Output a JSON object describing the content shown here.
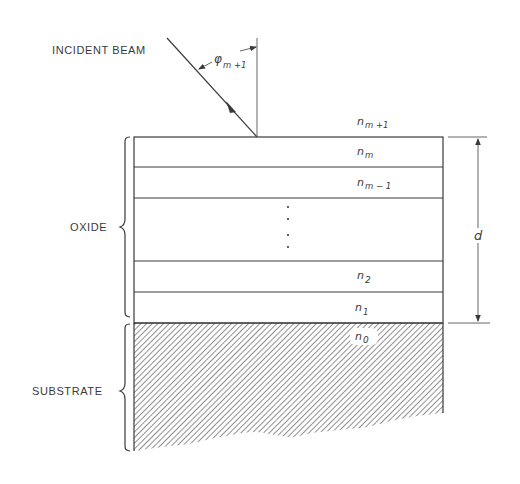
{
  "figure": {
    "caption_partial": "",
    "labels": {
      "incident_beam": "INCIDENT BEAM",
      "oxide": "OXIDE",
      "substrate": "SUBSTRATE",
      "thickness": "d",
      "angle_symbol": "φ",
      "angle_subscript": "m +1"
    },
    "layers": [
      {
        "symbol": "n",
        "subscript": "m +1",
        "region": "ambient"
      },
      {
        "symbol": "n",
        "subscript": "m",
        "region": "oxide"
      },
      {
        "symbol": "n",
        "subscript": "m − 1",
        "region": "oxide"
      },
      {
        "symbol": "⋮",
        "subscript": "",
        "region": "oxide-ellipsis"
      },
      {
        "symbol": "n",
        "subscript": "2",
        "region": "oxide"
      },
      {
        "symbol": "n",
        "subscript": "1",
        "region": "oxide"
      },
      {
        "symbol": "n",
        "subscript": "0",
        "region": "substrate"
      }
    ],
    "colors": {
      "line": "#3a3a3a",
      "hatch": "#555555",
      "background": "#ffffff"
    }
  }
}
